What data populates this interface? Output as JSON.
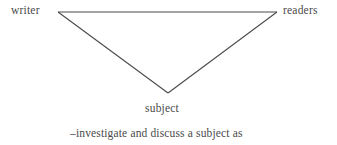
{
  "figure": {
    "type": "triangle-diagram",
    "background_color": "#ffffff",
    "line_color": "#4a4a4a",
    "text_color": "#4a4a4a",
    "nodes": [
      {
        "id": "writer",
        "label": "writer",
        "position": "top-left"
      },
      {
        "id": "readers",
        "label": "readers",
        "position": "top-right"
      },
      {
        "id": "subject",
        "label": "subject",
        "position": "bottom-center"
      }
    ],
    "vertices": {
      "left": {
        "x": 58,
        "y": 12
      },
      "right": {
        "x": 277,
        "y": 12
      },
      "apex": {
        "x": 168,
        "y": 93
      }
    },
    "caption": "–investigate and discuss a subject as"
  }
}
